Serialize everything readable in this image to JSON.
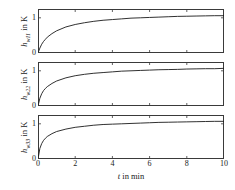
{
  "figure": {
    "background": "#ffffff",
    "axis_color": "#3a3a3a",
    "curve_color": "#1a1a1a"
  },
  "xlabel_parts": {
    "symbol": "t",
    "rest": " in min"
  },
  "panels": [
    {
      "ylabel_parts": {
        "symbol": "h",
        "sub": "w11",
        "rest": " in K"
      },
      "yticks": [
        "0",
        "1"
      ]
    },
    {
      "ylabel_parts": {
        "symbol": "h",
        "sub": "w22",
        "rest": " in K"
      },
      "yticks": [
        "0",
        "1"
      ]
    },
    {
      "ylabel_parts": {
        "symbol": "h",
        "sub": "w33",
        "rest": " in K"
      },
      "yticks": [
        "0",
        "1"
      ]
    }
  ],
  "xticks": [
    "0",
    "2",
    "4",
    "6",
    "8",
    "10"
  ],
  "chart_data": {
    "type": "line",
    "title": "",
    "xlabel": "t in min",
    "xlim": [
      0,
      10
    ],
    "ylim": [
      0,
      1.25
    ],
    "grid": false,
    "legend": "none",
    "xticks": [
      0,
      2,
      4,
      6,
      8,
      10
    ],
    "yticks": [
      0,
      1
    ],
    "x": [
      0,
      0.1,
      0.2,
      0.3,
      0.4,
      0.5,
      0.75,
      1,
      1.5,
      2,
      2.5,
      3,
      3.5,
      4,
      4.5,
      5,
      5.5,
      6,
      6.5,
      7,
      7.5,
      8,
      8.5,
      9,
      9.5,
      10
    ],
    "series": [
      {
        "name": "h_w11",
        "ylabel": "h_w11 in K",
        "values": [
          0,
          0.14,
          0.25,
          0.33,
          0.39,
          0.45,
          0.55,
          0.63,
          0.74,
          0.81,
          0.86,
          0.9,
          0.93,
          0.95,
          0.97,
          0.99,
          1.0,
          1.01,
          1.02,
          1.03,
          1.04,
          1.045,
          1.05,
          1.055,
          1.06,
          1.06
        ]
      },
      {
        "name": "h_w22",
        "ylabel": "h_w22 in K",
        "values": [
          0,
          0.22,
          0.35,
          0.44,
          0.5,
          0.55,
          0.64,
          0.71,
          0.8,
          0.86,
          0.9,
          0.93,
          0.95,
          0.97,
          0.99,
          1.0,
          1.01,
          1.02,
          1.03,
          1.035,
          1.04,
          1.05,
          1.055,
          1.06,
          1.06,
          1.07
        ]
      },
      {
        "name": "h_w33",
        "ylabel": "h_w33 in K",
        "values": [
          0,
          0.3,
          0.44,
          0.53,
          0.59,
          0.64,
          0.72,
          0.78,
          0.85,
          0.9,
          0.93,
          0.96,
          0.98,
          0.99,
          1.0,
          1.01,
          1.02,
          1.03,
          1.04,
          1.045,
          1.05,
          1.055,
          1.06,
          1.065,
          1.07,
          1.07
        ]
      }
    ]
  }
}
